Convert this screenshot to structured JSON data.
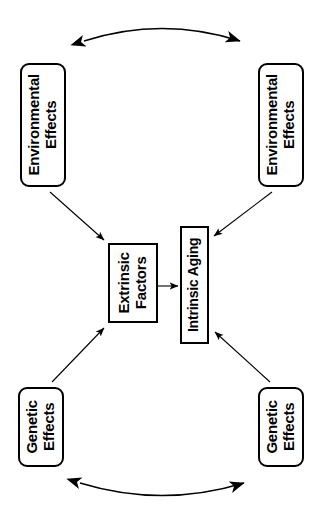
{
  "diagram": {
    "orientation": "rotated-90-ccw",
    "background_color": "#ffffff",
    "stroke_color": "#000000",
    "nodes": [
      {
        "id": "env-top",
        "label_line1": "Environmental",
        "label_line2": "Effects",
        "shape": "rounded-rectangle"
      },
      {
        "id": "env-bottom",
        "label_line1": "Environmental",
        "label_line2": "Effects",
        "shape": "rounded-rectangle"
      },
      {
        "id": "gen-left",
        "label_line1": "Genetic",
        "label_line2": "Effects",
        "shape": "rounded-rectangle"
      },
      {
        "id": "gen-right",
        "label_line1": "Genetic",
        "label_line2": "Effects",
        "shape": "rounded-rectangle"
      },
      {
        "id": "extrinsic",
        "label_line1": "Extrinsic",
        "label_line2": "Factors",
        "shape": "rectangle"
      },
      {
        "id": "intrinsic",
        "label_line1": "Intrinsic Aging",
        "label_line2": "",
        "shape": "rectangle"
      }
    ],
    "connectors": [
      {
        "id": "arc-top",
        "type": "double-headed-arc",
        "from": "env-top",
        "to": "env-bottom"
      },
      {
        "id": "arc-bottom",
        "type": "double-headed-arc",
        "from": "gen-left",
        "to": "gen-right"
      },
      {
        "id": "env-top-to-extrinsic",
        "type": "arrow",
        "from": "env-top",
        "to": "extrinsic"
      },
      {
        "id": "env-bottom-to-intrinsic",
        "type": "arrow",
        "from": "env-bottom",
        "to": "intrinsic"
      },
      {
        "id": "gen-left-to-extrinsic",
        "type": "arrow",
        "from": "gen-left",
        "to": "extrinsic"
      },
      {
        "id": "gen-right-to-intrinsic",
        "type": "arrow",
        "from": "gen-right",
        "to": "intrinsic"
      },
      {
        "id": "extrinsic-to-intrinsic",
        "type": "arrow",
        "from": "extrinsic",
        "to": "intrinsic"
      }
    ]
  }
}
